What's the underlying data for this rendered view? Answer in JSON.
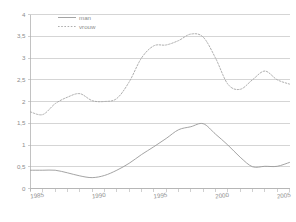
{
  "chart_data": {
    "type": "line",
    "title": "",
    "subtitle": "",
    "xlabel": "",
    "ylabel": "",
    "xlim": [
      1985,
      2006
    ],
    "ylim": [
      0,
      4
    ],
    "grid": true,
    "legend_position": "top-left-inside",
    "y_ticks": [
      0,
      0.5,
      1,
      1.5,
      2,
      2.5,
      3,
      3.5,
      4
    ],
    "y_tick_labels": [
      "0",
      "0,5",
      "1",
      "1,5",
      "2",
      "2,5",
      "3",
      "3,5",
      "4"
    ],
    "x_ticks": [
      1985,
      1986,
      1987,
      1988,
      1989,
      1990,
      1991,
      1992,
      1993,
      1994,
      1995,
      1996,
      1997,
      1998,
      1999,
      2000,
      2001,
      2002,
      2003,
      2004,
      2005,
      2006
    ],
    "x_tick_labels_shown": [
      {
        "x": 1985,
        "label": "1985"
      },
      {
        "x": 1990,
        "label": "1990"
      },
      {
        "x": 1995,
        "label": "1995"
      },
      {
        "x": 2000,
        "label": "2000"
      },
      {
        "x": 2005,
        "label": "2005"
      }
    ],
    "x": [
      1985,
      1986,
      1987,
      1988,
      1989,
      1990,
      1991,
      1992,
      1993,
      1994,
      1995,
      1996,
      1997,
      1998,
      1999,
      2000,
      2001,
      2002,
      2003,
      2004,
      2005,
      2006
    ],
    "series": [
      {
        "name": "man",
        "style": "solid",
        "color": "#9a9a9a",
        "values": [
          0.42,
          0.42,
          0.42,
          0.36,
          0.29,
          0.25,
          0.3,
          0.42,
          0.58,
          0.78,
          0.96,
          1.15,
          1.35,
          1.42,
          1.49,
          1.25,
          1.0,
          0.72,
          0.5,
          0.51,
          0.51,
          0.6
        ]
      },
      {
        "name": "vrouw",
        "style": "dashed",
        "color": "#a5a5a5",
        "values": [
          1.76,
          1.7,
          1.95,
          2.1,
          2.18,
          2.02,
          2.0,
          2.07,
          2.45,
          3.0,
          3.28,
          3.3,
          3.4,
          3.55,
          3.48,
          3.0,
          2.4,
          2.28,
          2.5,
          2.7,
          2.5,
          2.4
        ]
      }
    ],
    "legend": [
      {
        "label": "man",
        "style": "solid"
      },
      {
        "label": "vrouw",
        "style": "dashed"
      }
    ]
  }
}
